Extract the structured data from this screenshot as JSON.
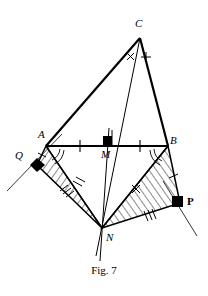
{
  "figure": {
    "caption": "Fig. 7",
    "background_color": "#ffffff",
    "stroke_color": "#000000",
    "hatch_color": "#000000",
    "labels": {
      "C": "C",
      "A": "A",
      "B": "B",
      "M": "M",
      "N": "N",
      "P": "P",
      "Q": "Q"
    },
    "angle_marks": {
      "at_C_left": "×",
      "at_C_right": "+",
      "on_BN": "×"
    },
    "points": {
      "C": {
        "x": 140,
        "y": 38
      },
      "A": {
        "x": 46,
        "y": 146
      },
      "B": {
        "x": 168,
        "y": 146
      },
      "M": {
        "x": 107,
        "y": 146
      },
      "N": {
        "x": 102,
        "y": 228
      },
      "P": {
        "x": 180,
        "y": 203
      },
      "Q": {
        "x": 37,
        "y": 165
      }
    },
    "shaded_regions": [
      {
        "name": "triangle-A-Q-N",
        "vertices": [
          "A",
          "Q",
          "N"
        ]
      },
      {
        "name": "triangle-B-P-N",
        "vertices": [
          "B",
          "P",
          "N"
        ]
      }
    ],
    "segments": [
      {
        "name": "segment-CA",
        "from": "C",
        "to": "A",
        "weight": "thick"
      },
      {
        "name": "segment-CB",
        "from": "C",
        "to": "B",
        "weight": "thick"
      },
      {
        "name": "segment-AB",
        "from": "A",
        "to": "B",
        "weight": "thick"
      },
      {
        "name": "segment-CN",
        "from": "C",
        "to": "N",
        "weight": "thin"
      },
      {
        "name": "segment-MN",
        "from": "M",
        "to": "N",
        "weight": "thin"
      },
      {
        "name": "segment-AQ",
        "from": "A",
        "to": "Q",
        "weight": "medium"
      },
      {
        "name": "segment-QN",
        "from": "Q",
        "to": "N",
        "weight": "medium"
      },
      {
        "name": "segment-AN",
        "from": "A",
        "to": "N",
        "weight": "medium"
      },
      {
        "name": "segment-BP",
        "from": "B",
        "to": "P",
        "weight": "medium"
      },
      {
        "name": "segment-PN",
        "from": "P",
        "to": "N",
        "weight": "medium"
      },
      {
        "name": "segment-BN",
        "from": "B",
        "to": "N",
        "weight": "medium"
      }
    ],
    "right_angle_markers": [
      "M",
      "Q",
      "P"
    ],
    "tick_marks": {
      "on_AB": 2,
      "on_AQ": 1,
      "on_QN": 3,
      "on_AN": 2,
      "on_BP": 1,
      "on_PN": 3,
      "on_BN_cross": 1
    },
    "arc_marks": {
      "at_A": 2,
      "at_B": 2
    }
  }
}
